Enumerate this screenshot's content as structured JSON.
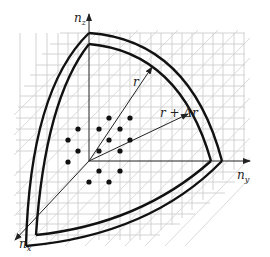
{
  "diagram": {
    "type": "k-space octant shell",
    "axes": {
      "z": {
        "label": "n",
        "subscript": "z"
      },
      "y": {
        "label": "n",
        "subscript": "y"
      },
      "x": {
        "label": "n",
        "subscript": "x"
      }
    },
    "arrows": {
      "inner": {
        "label": "r"
      },
      "outer": {
        "label": "r + Δr"
      }
    },
    "colors": {
      "ink": "#111111",
      "grid": "#c8c8c8",
      "background": "#ffffff"
    },
    "dot_count": 16
  }
}
